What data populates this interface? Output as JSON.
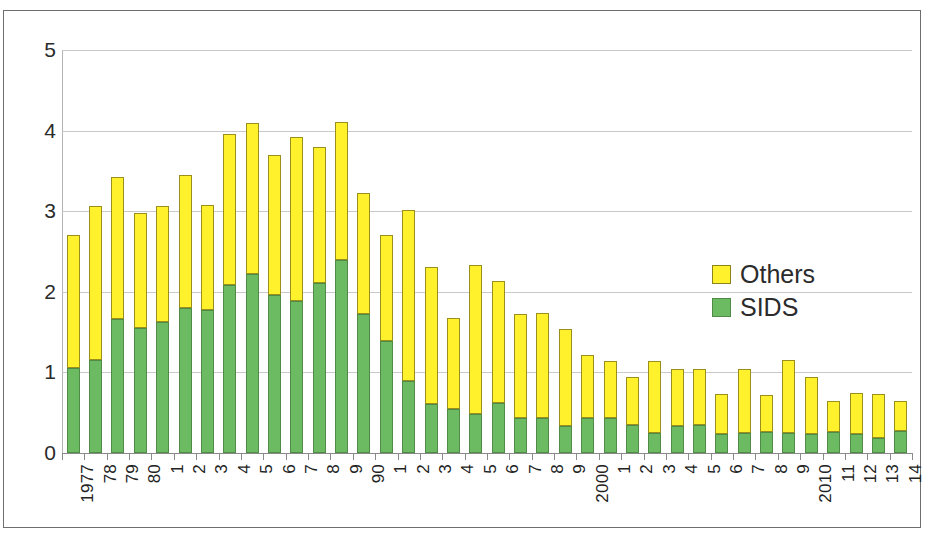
{
  "legend": {
    "position": "inside-right",
    "entries": [
      {
        "label": "Others",
        "color": "#fff22d"
      },
      {
        "label": "SIDS",
        "color": "#6cba61"
      }
    ]
  },
  "axes": {
    "y_ticks": [
      "0",
      "1",
      "2",
      "3",
      "4",
      "5"
    ],
    "x_tick_labels": [
      "1977",
      "78",
      "79",
      "80",
      "1",
      "2",
      "3",
      "4",
      "5",
      "6",
      "7",
      "8",
      "9",
      "90",
      "1",
      "2",
      "3",
      "4",
      "5",
      "6",
      "7",
      "8",
      "9",
      "2000",
      "1",
      "2",
      "3",
      "4",
      "5",
      "6",
      "7",
      "8",
      "9",
      "2010",
      "11",
      "12",
      "13",
      "14"
    ]
  },
  "chart_data": {
    "type": "bar",
    "stacked": true,
    "title": "",
    "subtitle": "",
    "xlabel": "",
    "ylabel": "",
    "ylim": [
      0,
      5
    ],
    "grid": true,
    "legend_position": "inside-right",
    "categories": [
      "1977",
      "78",
      "79",
      "80",
      "1",
      "2",
      "3",
      "4",
      "5",
      "6",
      "7",
      "8",
      "9",
      "90",
      "1",
      "2",
      "3",
      "4",
      "5",
      "6",
      "7",
      "8",
      "9",
      "2000",
      "1",
      "2",
      "3",
      "4",
      "5",
      "6",
      "7",
      "8",
      "9",
      "2010",
      "11",
      "12",
      "13",
      "14"
    ],
    "series": [
      {
        "name": "SIDS",
        "color": "#6cba61",
        "values": [
          1.05,
          1.15,
          1.66,
          1.55,
          1.62,
          1.8,
          1.78,
          2.09,
          2.22,
          1.96,
          1.89,
          2.11,
          2.4,
          1.72,
          1.39,
          0.89,
          0.61,
          0.55,
          0.49,
          0.62,
          0.43,
          0.44,
          0.34,
          0.44,
          0.44,
          0.35,
          0.25,
          0.33,
          0.35,
          0.24,
          0.25,
          0.26,
          0.25,
          0.23,
          0.26,
          0.23,
          0.19,
          0.27
        ]
      },
      {
        "name": "Others",
        "color": "#fff22d",
        "values": [
          1.66,
          1.91,
          1.77,
          1.43,
          1.44,
          1.65,
          1.3,
          1.87,
          1.88,
          1.74,
          2.03,
          1.69,
          1.71,
          1.5,
          1.31,
          2.13,
          1.7,
          1.12,
          1.84,
          1.51,
          1.29,
          1.3,
          1.2,
          0.78,
          0.7,
          0.59,
          0.89,
          0.71,
          0.69,
          0.49,
          0.79,
          0.46,
          0.9,
          0.71,
          0.39,
          0.51,
          0.54,
          0.38
        ]
      }
    ],
    "totals": [
      2.71,
      3.06,
      3.43,
      2.98,
      3.06,
      3.45,
      3.08,
      3.96,
      4.1,
      3.7,
      3.92,
      3.8,
      4.11,
      3.22,
      2.7,
      3.02,
      2.31,
      1.67,
      2.33,
      2.13,
      1.72,
      1.74,
      1.54,
      1.22,
      1.14,
      0.94,
      1.14,
      1.04,
      1.04,
      0.73,
      1.04,
      0.72,
      1.15,
      0.94,
      0.65,
      0.74,
      0.73,
      0.65
    ]
  }
}
